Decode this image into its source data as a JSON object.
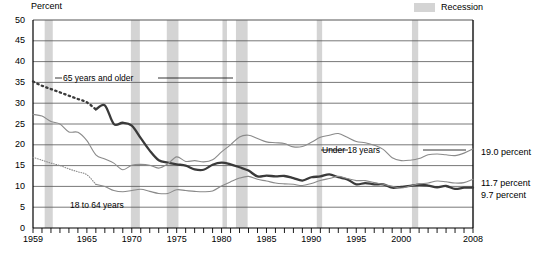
{
  "chart_data": {
    "type": "line",
    "title": "",
    "xlabel": "",
    "ylabel": "Percent",
    "ylim": [
      0,
      50
    ],
    "xlim": [
      1959,
      2008
    ],
    "ytick_labels": [
      "0",
      "5",
      "10",
      "15",
      "20",
      "25",
      "30",
      "35",
      "40",
      "45",
      "50"
    ],
    "ytick_values": [
      0,
      5,
      10,
      15,
      20,
      25,
      30,
      35,
      40,
      45,
      50
    ],
    "xtick_labels": [
      "1959",
      "1965",
      "1970",
      "1975",
      "1980",
      "1985",
      "1990",
      "1995",
      "2000",
      "2008"
    ],
    "xtick_values": [
      1959,
      1965,
      1970,
      1975,
      1980,
      1985,
      1990,
      1995,
      2000,
      2008
    ],
    "grid": "horizontal",
    "legend_position": "top-right",
    "legend": [
      {
        "label": "Recession",
        "color": "#d4d4d4",
        "kind": "band"
      }
    ],
    "annotations": [
      {
        "text": "65 years and older",
        "x": 1962.5,
        "y": 35.3
      },
      {
        "text": "Under 18 years",
        "x": 1993.0,
        "y": 23.6
      },
      {
        "text": "18 to 64 years",
        "x": 1964.0,
        "y": 6.6
      }
    ],
    "end_labels": [
      {
        "text": "19.0 percent",
        "value": 19.0,
        "series": "Under 18 years"
      },
      {
        "text": "11.7 percent",
        "value": 11.7,
        "series": "18 to 64 years"
      },
      {
        "text": "9.7 percent",
        "value": 9.7,
        "series": "65 years and older"
      }
    ],
    "recessions": [
      {
        "start": 1960.3,
        "end": 1961.2
      },
      {
        "start": 1969.9,
        "end": 1970.9
      },
      {
        "start": 1973.9,
        "end": 1975.2
      },
      {
        "start": 1980.1,
        "end": 1980.6
      },
      {
        "start": 1981.6,
        "end": 1982.9
      },
      {
        "start": 1990.6,
        "end": 1991.2
      },
      {
        "start": 2001.2,
        "end": 2001.9
      },
      {
        "start": 2007.9,
        "end": 2008.5
      }
    ],
    "series": [
      {
        "name": "65 years and older",
        "color": "#3a3a3a",
        "width": 2.3,
        "dashed_until": 1966,
        "x": [
          1959,
          1960,
          1961,
          1962,
          1963,
          1964,
          1965,
          1966,
          1967,
          1968,
          1969,
          1970,
          1971,
          1972,
          1973,
          1974,
          1975,
          1976,
          1977,
          1978,
          1979,
          1980,
          1981,
          1982,
          1983,
          1984,
          1985,
          1986,
          1987,
          1988,
          1989,
          1990,
          1991,
          1992,
          1993,
          1994,
          1995,
          1996,
          1997,
          1998,
          1999,
          2000,
          2001,
          2002,
          2003,
          2004,
          2005,
          2006,
          2007,
          2008
        ],
        "values": [
          35.2,
          34.2,
          33.4,
          32.6,
          31.8,
          31.0,
          30.2,
          28.5,
          29.5,
          25.0,
          25.3,
          24.6,
          21.6,
          18.6,
          16.3,
          15.7,
          15.3,
          15.0,
          14.1,
          14.0,
          15.2,
          15.7,
          15.3,
          14.6,
          13.8,
          12.4,
          12.6,
          12.4,
          12.5,
          12.0,
          11.4,
          12.2,
          12.4,
          12.9,
          12.2,
          11.7,
          10.5,
          10.8,
          10.5,
          10.5,
          9.7,
          9.9,
          10.1,
          10.4,
          10.2,
          9.8,
          10.1,
          9.4,
          9.7,
          9.7
        ]
      },
      {
        "name": "Under 18 years",
        "color": "#8a8a8a",
        "width": 1.1,
        "dashed_until": null,
        "x": [
          1959,
          1960,
          1961,
          1962,
          1963,
          1964,
          1965,
          1966,
          1967,
          1968,
          1969,
          1970,
          1971,
          1972,
          1973,
          1974,
          1975,
          1976,
          1977,
          1978,
          1979,
          1980,
          1981,
          1982,
          1983,
          1984,
          1985,
          1986,
          1987,
          1988,
          1989,
          1990,
          1991,
          1992,
          1993,
          1994,
          1995,
          1996,
          1997,
          1998,
          1999,
          2000,
          2001,
          2002,
          2003,
          2004,
          2005,
          2006,
          2007,
          2008
        ],
        "values": [
          27.3,
          26.9,
          25.6,
          25.0,
          23.1,
          23.0,
          21.0,
          17.6,
          16.6,
          15.6,
          14.0,
          15.1,
          15.3,
          15.1,
          14.4,
          15.4,
          17.1,
          16.0,
          16.2,
          15.9,
          16.4,
          18.3,
          20.0,
          21.9,
          22.3,
          21.5,
          20.7,
          20.5,
          20.3,
          19.5,
          19.6,
          20.6,
          21.8,
          22.3,
          22.7,
          21.8,
          20.8,
          20.5,
          19.9,
          18.9,
          16.9,
          16.2,
          16.3,
          16.7,
          17.6,
          17.8,
          17.6,
          17.4,
          18.0,
          19.0
        ]
      },
      {
        "name": "18 to 64 years",
        "color": "#8a8a8a",
        "width": 1.1,
        "dashed_until": 1966,
        "x": [
          1959,
          1960,
          1961,
          1962,
          1963,
          1964,
          1965,
          1966,
          1967,
          1968,
          1969,
          1970,
          1971,
          1972,
          1973,
          1974,
          1975,
          1976,
          1977,
          1978,
          1979,
          1980,
          1981,
          1982,
          1983,
          1984,
          1985,
          1986,
          1987,
          1988,
          1989,
          1990,
          1991,
          1992,
          1993,
          1994,
          1995,
          1996,
          1997,
          1998,
          1999,
          2000,
          2001,
          2002,
          2003,
          2004,
          2005,
          2006,
          2007,
          2008
        ],
        "values": [
          17.0,
          16.3,
          15.6,
          15.0,
          14.2,
          13.5,
          12.8,
          10.5,
          10.0,
          9.0,
          8.7,
          9.0,
          9.3,
          8.8,
          8.3,
          8.3,
          9.2,
          9.0,
          8.8,
          8.7,
          8.9,
          10.1,
          11.1,
          12.0,
          12.4,
          11.7,
          11.3,
          10.8,
          10.6,
          10.5,
          10.2,
          10.7,
          11.4,
          11.9,
          12.4,
          11.9,
          11.4,
          11.4,
          10.9,
          10.5,
          10.0,
          9.6,
          10.1,
          10.6,
          10.8,
          11.3,
          11.1,
          10.8,
          10.9,
          11.7
        ]
      }
    ]
  },
  "axis": {
    "y_title": "Percent"
  },
  "legend": {
    "recession_label": "Recession"
  },
  "annotations": {
    "older65": "65 years and older",
    "under18": "Under 18 years",
    "adults1864": "18 to 64 years"
  },
  "end_labels": {
    "under18": "19.0 percent",
    "adults1864": "11.7 percent",
    "older65": "9.7 percent"
  },
  "yticks": [
    "50",
    "45",
    "40",
    "35",
    "30",
    "25",
    "20",
    "15",
    "10",
    "5",
    "0"
  ],
  "xticks": [
    "1959",
    "1965",
    "1970",
    "1975",
    "1980",
    "1985",
    "1990",
    "1995",
    "2000",
    "2008"
  ],
  "colors": {
    "recession_band": "#d4d4d4",
    "series_older65": "#3a3a3a",
    "series_thin": "#8a8a8a",
    "gridline": "#555555",
    "axis": "#000000"
  }
}
